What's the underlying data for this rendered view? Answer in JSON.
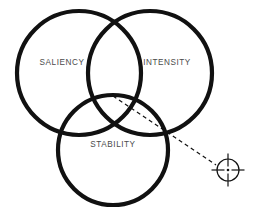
{
  "diagram": {
    "background_color": "#ffffff",
    "stroke_color": "#111111",
    "label_color": "#4a4a4a",
    "circles": [
      {
        "id": "saliency",
        "label": "SALIENCY",
        "cx": 79,
        "cy": 73,
        "r": 62,
        "stroke_width": 4.2,
        "label_x": 62,
        "label_y": 63
      },
      {
        "id": "intensity",
        "label": "INTENSITY",
        "cx": 150,
        "cy": 73,
        "r": 62,
        "stroke_width": 4.2,
        "label_x": 167,
        "label_y": 63
      },
      {
        "id": "stability",
        "label": "STABILITY",
        "cx": 113,
        "cy": 150,
        "r": 55,
        "stroke_width": 4.2,
        "label_x": 113,
        "label_y": 145
      }
    ],
    "leader": {
      "id": "leader-line",
      "x1": 113,
      "y1": 96,
      "x2": 216,
      "y2": 165,
      "stroke_width": 1.2,
      "dash_pattern": "4 3.2"
    },
    "target": {
      "id": "crosshair-target",
      "cx": 228,
      "cy": 170,
      "ring_r": 11,
      "tick_outer": 16.5,
      "dot_r": 1.3,
      "stroke_width": 1.2
    }
  }
}
